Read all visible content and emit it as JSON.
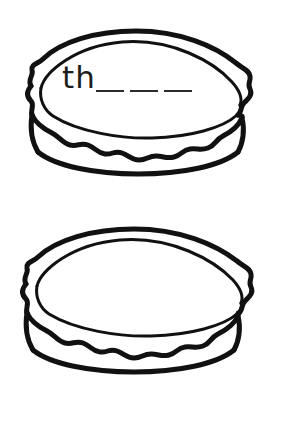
{
  "page": {
    "background_color": "#ffffff",
    "ink_color": "#1a1a1a",
    "width": 282,
    "height": 438
  },
  "items": [
    {
      "id": "pie-top",
      "illustration": "pie-icon",
      "prefix": "th",
      "suffix": "",
      "blanks": 3,
      "blank_glyph": "_"
    },
    {
      "id": "pie-bottom",
      "illustration": "pie-icon",
      "prefix": "",
      "suffix": "s",
      "blanks": 4,
      "blank_glyph": "_"
    }
  ]
}
